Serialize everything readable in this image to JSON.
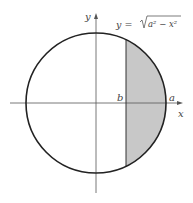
{
  "diagram": {
    "equation_label": "y = √(a² − x²)",
    "equation_parts": {
      "lhs": "y =",
      "radicand": "a² − x²"
    },
    "axis_labels": {
      "x": "x",
      "y": "y"
    },
    "point_labels": {
      "b": "b",
      "a": "a"
    },
    "colors": {
      "stroke": "#222222",
      "axis": "#555555",
      "shade": "#c8c8c8"
    },
    "circle": {
      "cx": 96,
      "cy": 103,
      "r": 70
    },
    "cut_line_x": 126
  }
}
